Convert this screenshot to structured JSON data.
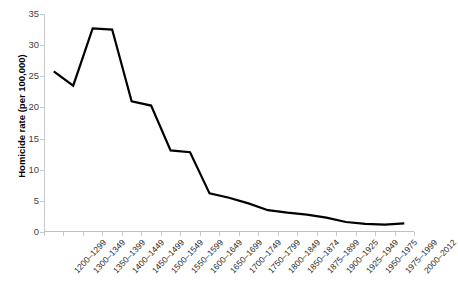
{
  "chart_data": {
    "type": "line",
    "title": "",
    "xlabel": "",
    "ylabel": "Homicide rate (per 100,000)",
    "ylim": [
      0,
      35
    ],
    "yticks": [
      0,
      5,
      10,
      15,
      20,
      25,
      30,
      35
    ],
    "grid": false,
    "legend": false,
    "line_color": "#000000",
    "categories": [
      "1200–1299",
      "1300–1349",
      "1350–1399",
      "1400–1449",
      "1450–1499",
      "1500–1549",
      "1550–1599",
      "1600–1649",
      "1650–1699",
      "1700–1749",
      "1750–1799",
      "1800–1849",
      "1850–1874",
      "1875–1899",
      "1900–1925",
      "1925–1949",
      "1950–1975",
      "1975–1999",
      "2000–2012"
    ],
    "values": [
      25.8,
      23.5,
      32.7,
      32.5,
      21.0,
      20.3,
      13.1,
      12.8,
      6.2,
      5.5,
      4.6,
      3.5,
      3.1,
      2.8,
      2.3,
      1.6,
      1.3,
      1.2,
      1.4
    ]
  }
}
